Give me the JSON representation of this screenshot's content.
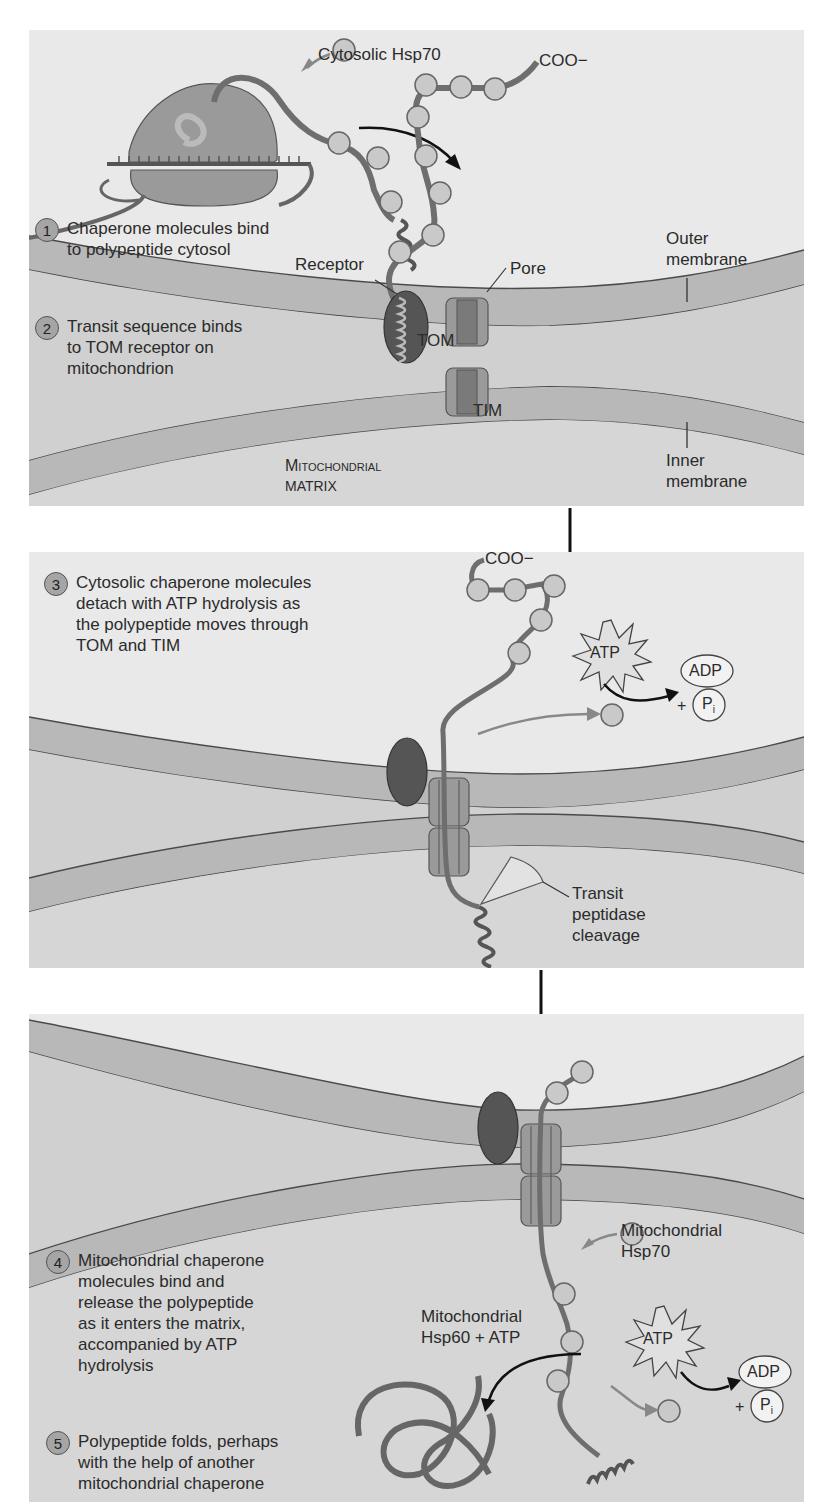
{
  "diagram": {
    "colors": {
      "panel_bg": "#e9e9e9",
      "membrane": "#b8b8b8",
      "membrane_edge": "#4a4a4a",
      "matrix": "#d2d2d2",
      "chain": "#707070",
      "bead": "#c9c9c9",
      "receptor": "#555555",
      "pore": "#8c8c8c",
      "arrow_black": "#111111",
      "arrow_gray": "#888888"
    },
    "panels": [
      {
        "id": "panel-1",
        "steps": [
          {
            "number": "1",
            "text": "Chaperone molecules bind\nto polypeptide cytosol"
          },
          {
            "number": "2",
            "text": "Transit sequence binds\nto TOM receptor on\nmitochondrion"
          }
        ],
        "labels": {
          "cytosolic_hsp70": "Cytosolic Hsp70",
          "coo": "COO−",
          "receptor": "Receptor",
          "pore": "Pore",
          "tom": "TOM",
          "tim": "TIM",
          "outer_membrane": "Outer\nmembrane",
          "inner_membrane": "Inner\nmembrane",
          "matrix_line1": "Mitochondrial",
          "matrix_line2": "MATRIX"
        }
      },
      {
        "id": "panel-2",
        "steps": [
          {
            "number": "3",
            "text": "Cytosolic chaperone molecules\ndetach with ATP hydrolysis as\nthe polypeptide moves through\nTOM and TIM"
          }
        ],
        "labels": {
          "coo": "COO−",
          "atp": "ATP",
          "adp": "ADP",
          "plus": "+",
          "pi": "P",
          "pi_sub": "i",
          "transit_peptidase": "Transit\npeptidase\ncleavage"
        }
      },
      {
        "id": "panel-3",
        "steps": [
          {
            "number": "4",
            "text": "Mitochondrial chaperone\nmolecules bind and\nrelease the polypeptide\nas it enters the matrix,\naccompanied by ATP\nhydrolysis"
          },
          {
            "number": "5",
            "text": "Polypeptide folds, perhaps\nwith the help of another\nmitochondrial chaperone"
          }
        ],
        "labels": {
          "mito_hsp70": "Mitochondrial\nHsp70",
          "mito_hsp60": "Mitochondrial\nHsp60 + ATP",
          "atp": "ATP",
          "adp": "ADP",
          "plus": "+",
          "pi": "P",
          "pi_sub": "i"
        }
      }
    ]
  }
}
